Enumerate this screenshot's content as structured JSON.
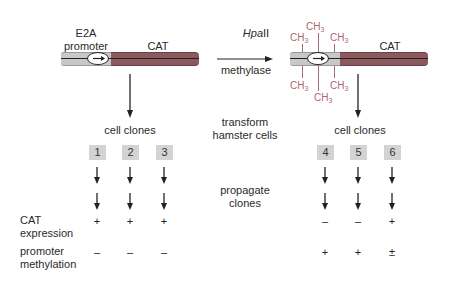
{
  "left_construct": {
    "promoter_label_line1": "E2A",
    "promoter_label_line2": "promoter",
    "gene_label": "CAT"
  },
  "enzyme": {
    "name_italic": "Hpa",
    "name_roman": "II",
    "label": "methylase"
  },
  "right_construct": {
    "gene_label": "CAT",
    "methyl_groups": [
      "CH3",
      "CH3",
      "CH3",
      "CH3",
      "CH3",
      "CH3"
    ]
  },
  "steps": {
    "transform_line1": "transform",
    "transform_line2": "hamster cells",
    "propagate_line1": "propagate",
    "propagate_line2": "clones"
  },
  "left_clones": {
    "title": "cell clones",
    "ids": [
      "1",
      "2",
      "3"
    ],
    "cat_expression": [
      "+",
      "+",
      "+"
    ],
    "promoter_methylation": [
      "–",
      "–",
      "–"
    ]
  },
  "right_clones": {
    "title": "cell clones",
    "ids": [
      "4",
      "5",
      "6"
    ],
    "cat_expression": [
      "–",
      "–",
      "+"
    ],
    "promoter_methylation": [
      "+",
      "+",
      "±"
    ]
  },
  "row_labels": {
    "cat_expression_line1": "CAT",
    "cat_expression_line2": "expression",
    "methylation_line1": "promoter",
    "methylation_line2": "methylation"
  },
  "colors": {
    "promoter_gray": "#c8c8c8",
    "cat_red": "#8c5a5e",
    "methyl_pink": "#a86a70",
    "clone_box": "#d3d3d3"
  }
}
